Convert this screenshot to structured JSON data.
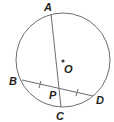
{
  "diagram": {
    "type": "circle-chords",
    "colors": {
      "stroke": "#6d6e70",
      "text": "#231f20",
      "center_dot": "#3a3a3a"
    },
    "circle": {
      "center": "O",
      "cx": 63,
      "cy": 60,
      "r": 47
    },
    "points": {
      "A": {
        "label": "A",
        "x": 51,
        "y": 14
      },
      "B": {
        "label": "B",
        "x": 22,
        "y": 80
      },
      "C": {
        "label": "C",
        "x": 61,
        "y": 108
      },
      "D": {
        "label": "D",
        "x": 93,
        "y": 96
      },
      "P": {
        "label": "P"
      },
      "O": {
        "label": "O"
      }
    },
    "chords": [
      "AC",
      "BD"
    ],
    "intersection": "P",
    "congruent_segments": [
      "BP",
      "PD"
    ]
  }
}
